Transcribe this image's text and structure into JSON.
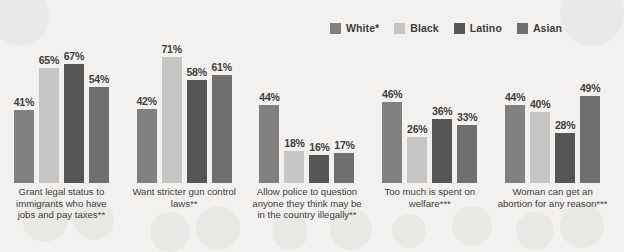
{
  "chart_data": {
    "type": "bar",
    "title": "",
    "xlabel": "",
    "ylabel": "",
    "ylim": [
      0,
      100
    ],
    "grid": false,
    "legend_position": "top-right",
    "categories": [
      "Grant legal status to immigrants who have jobs and pay taxes**",
      "Want stricter gun control laws**",
      "Allow police to question anyone they think may be in the country illegally**",
      "Too much is spent on welfare***",
      "Woman can get an abortion for any reason***"
    ],
    "series": [
      {
        "name": "White*",
        "color": "#808080",
        "values": [
          41,
          42,
          44,
          46,
          44
        ],
        "value_labels": [
          "41%",
          "42%",
          "44%",
          "46%",
          "44%"
        ]
      },
      {
        "name": "Black",
        "color": "#c6c6c4",
        "values": [
          65,
          71,
          18,
          26,
          40
        ],
        "value_labels": [
          "65%",
          "71%",
          "18%",
          "26%",
          "40%"
        ]
      },
      {
        "name": "Latino",
        "color": "#565656",
        "values": [
          67,
          58,
          16,
          36,
          28
        ],
        "value_labels": [
          "67%",
          "58%",
          "16%",
          "36%",
          "28%"
        ]
      },
      {
        "name": "Asian",
        "color": "#6f6f6f",
        "values": [
          54,
          61,
          17,
          33,
          49
        ],
        "value_labels": [
          "54%",
          "61%",
          "17%",
          "33%",
          "49%"
        ]
      }
    ]
  },
  "legend": {
    "items": [
      {
        "label": "White*",
        "color": "#808080"
      },
      {
        "label": "Black",
        "color": "#c6c6c4"
      },
      {
        "label": "Latino",
        "color": "#565656"
      },
      {
        "label": "Asian",
        "color": "#6f6f6f"
      }
    ]
  }
}
